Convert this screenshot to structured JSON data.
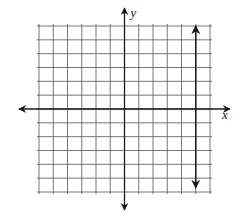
{
  "chart_data": {
    "type": "line",
    "title": "",
    "xlabel": "x",
    "ylabel": "y",
    "xlim": [
      -6,
      6
    ],
    "ylim": [
      -6,
      6
    ],
    "grid": true,
    "grid_step": 1,
    "axes_arrows": true,
    "series": [
      {
        "name": "vertical line x = 5",
        "equation": "x = 5",
        "points": [
          [
            5,
            6
          ],
          [
            5,
            -5.7
          ]
        ],
        "arrows_both_ends": true
      }
    ]
  },
  "colors": {
    "grid": "#555555",
    "axis": "#1a1a1a",
    "line": "#1a1a1a",
    "background": "#ffffff"
  },
  "labels": {
    "x_axis": "x",
    "y_axis": "y"
  }
}
